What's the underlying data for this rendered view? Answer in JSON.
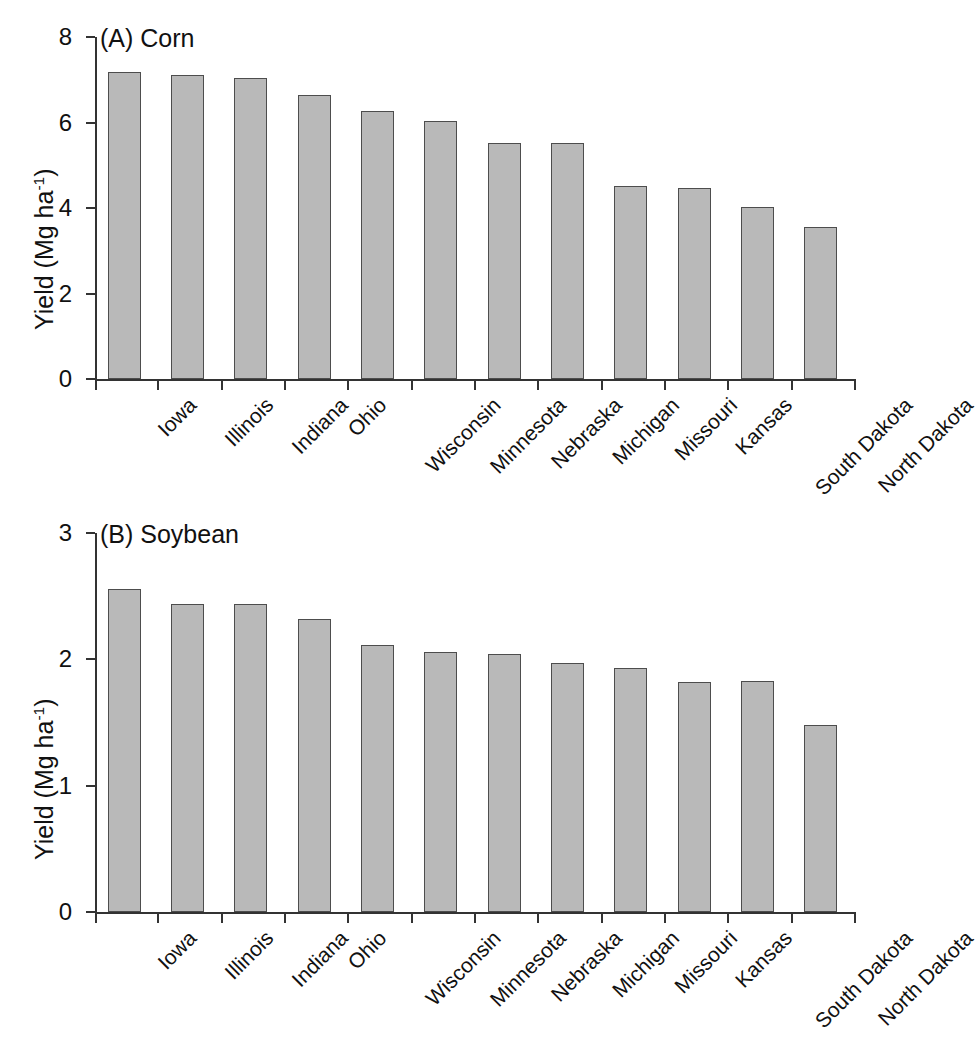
{
  "figure": {
    "axis_title_y": "Yield (Mg ha",
    "axis_title_y_sup": "-1",
    "axis_title_y_close": ")"
  },
  "chart_data": [
    {
      "type": "bar",
      "panel": "A",
      "title": "(A) Corn",
      "crop": "Corn",
      "xlabel": "",
      "ylabel": "Yield (Mg ha-1)",
      "ylim": [
        0,
        8
      ],
      "yticks": [
        0,
        2,
        4,
        6,
        8
      ],
      "ytick_labels": [
        "0",
        "2",
        "4",
        "6",
        "8"
      ],
      "grid": false,
      "legend": "none",
      "categories": [
        "Iowa",
        "Illinois",
        "Indiana",
        "Ohio",
        "Wisconsin",
        "Minnesota",
        "Nebraska",
        "Michigan",
        "Missouri",
        "Kansas",
        "South Dakota",
        "North Dakota"
      ],
      "values": [
        7.19,
        7.11,
        7.04,
        6.64,
        6.27,
        6.03,
        5.51,
        5.51,
        4.51,
        4.47,
        4.02,
        3.55
      ]
    },
    {
      "type": "bar",
      "panel": "B",
      "title": "(B) Soybean",
      "crop": "Soybean",
      "xlabel": "",
      "ylabel": "Yield (Mg ha-1)",
      "ylim": [
        0,
        3
      ],
      "yticks": [
        0,
        1,
        2,
        3
      ],
      "ytick_labels": [
        "0",
        "1",
        "2",
        "3"
      ],
      "grid": false,
      "legend": "none",
      "categories": [
        "Iowa",
        "Illinois",
        "Indiana",
        "Ohio",
        "Wisconsin",
        "Minnesota",
        "Nebraska",
        "Michigan",
        "Missouri",
        "Kansas",
        "South Dakota",
        "North Dakota"
      ],
      "values": [
        2.56,
        2.44,
        2.44,
        2.32,
        2.11,
        2.06,
        2.04,
        1.97,
        1.93,
        1.82,
        1.83,
        1.48
      ]
    }
  ]
}
